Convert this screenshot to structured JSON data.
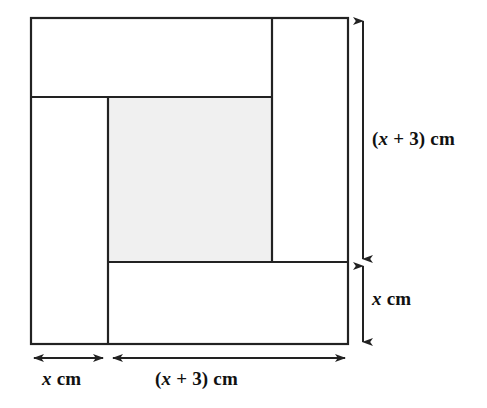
{
  "figure": {
    "colors": {
      "stroke": "#222222",
      "shaded_fill": "#f0f0f0",
      "plain_fill": "#ffffff",
      "background": "#ffffff",
      "text": "#111111"
    },
    "outer_square": {
      "x": 31,
      "y": 18,
      "width": 317,
      "height": 326
    },
    "shaded_rect": {
      "x": 108,
      "y": 97,
      "width": 164,
      "height": 165
    },
    "divider_lines": {
      "vertical_left_strip_x": 108,
      "vertical_right_inner_x": 272,
      "horizontal_upper_y": 97,
      "horizontal_lower_y": 262
    },
    "labels": {
      "right_height": {
        "prefix": "(",
        "variable": "x",
        "middle": " + 3) cm",
        "full": "(x + 3) cm"
      },
      "right_bottom": {
        "variable": "x",
        "middle": " cm",
        "full": "x cm"
      },
      "bottom_left": {
        "variable": "x",
        "middle": " cm",
        "full": "x cm"
      },
      "bottom_right": {
        "prefix": "(",
        "variable": "x",
        "middle": " + 3) cm",
        "full": "(x + 3) cm"
      }
    },
    "arrows": {
      "right_tall": {
        "x": 363,
        "y_top": 18,
        "y_bottom": 262,
        "double_headed": true
      },
      "right_short": {
        "x": 363,
        "y_top": 262,
        "y_bottom": 345,
        "double_headed": true
      },
      "bottom_short": {
        "y": 358,
        "x_left": 31,
        "x_right": 106,
        "double_headed": true
      },
      "bottom_long": {
        "y": 358,
        "x_left": 110,
        "x_right": 348,
        "double_headed": true
      }
    }
  }
}
